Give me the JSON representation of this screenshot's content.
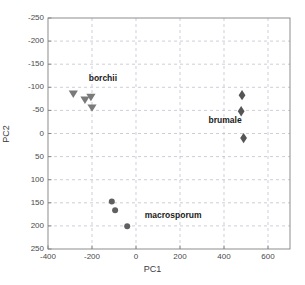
{
  "chart_data": {
    "type": "scatter",
    "title": "",
    "xlabel": "PC1",
    "ylabel": "PC2",
    "xlim": [
      -400,
      700
    ],
    "ylim": [
      -250,
      250
    ],
    "xticks": [
      -400,
      -200,
      0,
      200,
      400,
      600
    ],
    "yticks": [
      -250,
      -200,
      -150,
      -100,
      -50,
      0,
      50,
      100,
      150,
      200,
      250
    ],
    "grid": true,
    "legend_position": "inline-annotations",
    "series": [
      {
        "name": "borchii",
        "marker": "triangle-down",
        "color": "#7a7a7a",
        "points": [
          {
            "x": -285,
            "y": 85
          },
          {
            "x": -232,
            "y": 72
          },
          {
            "x": -205,
            "y": 78
          },
          {
            "x": -200,
            "y": 55
          }
        ],
        "annotation": {
          "text": "borchii",
          "x": -215,
          "y": 118
        }
      },
      {
        "name": "brumale",
        "marker": "diamond",
        "color": "#555555",
        "points": [
          {
            "x": 482,
            "y": 83
          },
          {
            "x": 478,
            "y": 48
          },
          {
            "x": 489,
            "y": -10
          }
        ],
        "annotation": {
          "text": "brumale",
          "x": 330,
          "y": 28
        }
      },
      {
        "name": "macrosporum",
        "marker": "circle",
        "color": "#606060",
        "points": [
          {
            "x": -110,
            "y": -147
          },
          {
            "x": -95,
            "y": -166
          },
          {
            "x": -40,
            "y": -201
          }
        ],
        "annotation": {
          "text": "macrosporum",
          "x": 40,
          "y": -178
        }
      }
    ],
    "colors": {
      "axis": "#808080",
      "grid": "#b9b9c9",
      "tick_text": "#4a4a4a",
      "label_text": "#1a1a1a",
      "background": "#ffffff"
    }
  },
  "axes": {
    "xlabel": "PC1",
    "ylabel": "PC2",
    "xtick_labels": [
      "-400",
      "-200",
      "0",
      "200",
      "400",
      "600"
    ],
    "ytick_labels": [
      "250",
      "200",
      "150",
      "100",
      "50",
      "0",
      "-50",
      "-100",
      "-150",
      "-200",
      "-250"
    ]
  },
  "annotations": {
    "borchii": "borchii",
    "brumale": "brumale",
    "macrosporum": "macrosporum"
  }
}
